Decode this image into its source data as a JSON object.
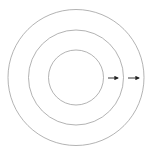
{
  "diagram": {
    "type": "concentric-circles",
    "circle_count": 3,
    "circles": [
      {
        "id": "outer",
        "stroke": "#a0a0a0"
      },
      {
        "id": "middle",
        "stroke": "#a0a0a0"
      },
      {
        "id": "inner",
        "stroke": "#a0a0a0"
      }
    ],
    "arrows": [
      {
        "id": "arrow-inner-gap",
        "direction": "right",
        "color": "#222222"
      },
      {
        "id": "arrow-outer-gap",
        "direction": "right",
        "color": "#222222"
      }
    ],
    "background": "#ffffff"
  }
}
